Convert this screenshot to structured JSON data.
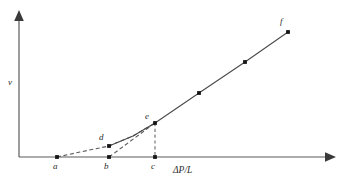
{
  "chart_data": {
    "type": "line",
    "title": "",
    "subtitle": "",
    "xlabel": "ΔP/L",
    "ylabel": "v",
    "xlim": [
      0,
      344
    ],
    "ylim": [
      0,
      187
    ],
    "grid": false,
    "legend": null,
    "annotations": [
      {
        "id": "a",
        "label": "a",
        "x": 57,
        "y": 157,
        "label_x": 53,
        "label_y": 162,
        "on_axis": true
      },
      {
        "id": "b",
        "label": "b",
        "x": 109,
        "y": 157,
        "label_x": 104,
        "label_y": 162,
        "on_axis": true
      },
      {
        "id": "c",
        "label": "c",
        "x": 155,
        "y": 157,
        "label_x": 151,
        "label_y": 162,
        "on_axis": true
      },
      {
        "id": "d",
        "label": "d",
        "x": 109,
        "y": 146,
        "label_x": 99,
        "label_y": 133,
        "on_axis": false
      },
      {
        "id": "e",
        "label": "e",
        "x": 155,
        "y": 123,
        "label_x": 145,
        "label_y": 112,
        "on_axis": false
      },
      {
        "id": "f",
        "label": "f",
        "x": 288,
        "y": 32,
        "label_x": 280,
        "label_y": 17,
        "on_axis": false
      }
    ],
    "series": [
      {
        "name": "yield-region-dashed-curve",
        "style": "dashed",
        "points": [
          [
            57,
            157
          ],
          [
            80,
            152
          ],
          [
            109,
            146
          ],
          [
            133,
            136
          ],
          [
            155,
            123
          ]
        ]
      },
      {
        "name": "bingham-extrapolation-dashed",
        "style": "dashed",
        "points": [
          [
            109,
            157
          ],
          [
            155,
            123
          ]
        ]
      },
      {
        "name": "linear-flow-solid",
        "style": "solid",
        "points": [
          [
            155,
            123
          ],
          [
            199,
            93
          ],
          [
            245,
            62
          ],
          [
            288,
            32
          ]
        ]
      },
      {
        "name": "yield-region-solid-overlay",
        "style": "solid",
        "points": [
          [
            109,
            146
          ],
          [
            133,
            136
          ],
          [
            155,
            123
          ]
        ]
      }
    ],
    "dropline": {
      "name": "e-to-c-dropline",
      "style": "dashed",
      "points": [
        [
          155,
          123
        ],
        [
          155,
          157
        ]
      ]
    },
    "markers": [
      [
        57,
        157
      ],
      [
        109,
        157
      ],
      [
        155,
        157
      ],
      [
        109,
        146
      ],
      [
        155,
        123
      ],
      [
        199,
        93
      ],
      [
        245,
        62
      ],
      [
        288,
        32
      ]
    ],
    "axes": {
      "x_axis": {
        "x1": 19,
        "y1": 157,
        "x2": 336,
        "y2": 157,
        "arrow": "right"
      },
      "y_axis": {
        "x1": 19,
        "y1": 157,
        "x2": 19,
        "y2": 10,
        "arrow": "up"
      }
    },
    "colors": {
      "axis": "#5a5a5a",
      "curve": "#4a4a4a",
      "marker": "#151515",
      "background": "#ffffff",
      "text": "#2a2a2a"
    }
  }
}
